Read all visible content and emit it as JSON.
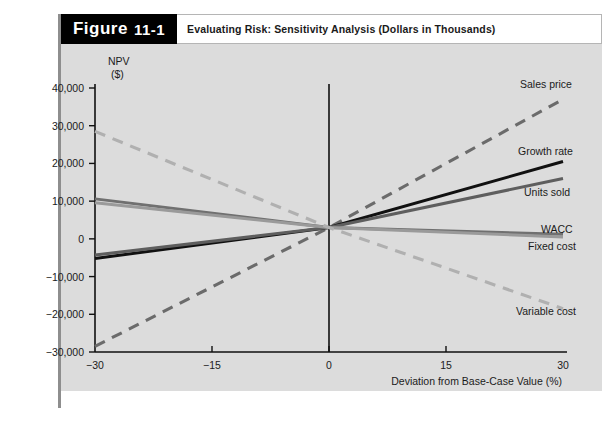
{
  "figure": {
    "tag_word": "Figure",
    "tag_number": "11-1",
    "caption": "Evaluating Risk: Sensitivity Analysis (Dollars in Thousands)"
  },
  "chart_data": {
    "type": "line",
    "title": "Evaluating Risk: Sensitivity Analysis (Dollars in Thousands)",
    "xlabel": "Deviation from Base-Case Value (%)",
    "ylabel": "NPV ($)",
    "ylabel_line1": "NPV",
    "ylabel_line2": "($)",
    "x": [
      -30,
      0,
      30
    ],
    "xlim": [
      -30,
      30
    ],
    "ylim": [
      -30000,
      40000
    ],
    "xticks": [
      -30,
      -15,
      0,
      15,
      30
    ],
    "xtick_labels": [
      "−30",
      "−15",
      "0",
      "15",
      "30"
    ],
    "yticks": [
      40000,
      30000,
      20000,
      10000,
      0,
      -10000,
      -20000,
      -30000
    ],
    "ytick_labels": [
      "40,000",
      "30,000",
      "20,000",
      "10,000",
      "0",
      "−10,000",
      "−20,000",
      "−30,000"
    ],
    "grid": false,
    "legend_position": "right-inline",
    "base_case_npv": 3000,
    "series": [
      {
        "name": "Sales price",
        "label": "Sales price",
        "values": [
          -28500,
          3000,
          37000
        ],
        "color": "#6b6b6b",
        "style": "dashed",
        "width": 3.1,
        "label_x": 520,
        "label_y": 88
      },
      {
        "name": "Growth rate",
        "label": "Growth rate",
        "values": [
          -5200,
          3000,
          20500
        ],
        "color": "#111111",
        "style": "solid",
        "width": 3.0,
        "label_x": 518,
        "label_y": 155
      },
      {
        "name": "Units sold",
        "label": "Units sold",
        "values": [
          -4300,
          3000,
          16000
        ],
        "color": "#5e5e5e",
        "style": "solid",
        "width": 3.0,
        "label_x": 524,
        "label_y": 196
      },
      {
        "name": "WACC",
        "label": "WACC",
        "values": [
          10600,
          3000,
          1200
        ],
        "color": "#707070",
        "style": "solid",
        "width": 3.0,
        "label_x": 541,
        "label_y": 233
      },
      {
        "name": "Fixed cost",
        "label": "Fixed cost",
        "values": [
          9600,
          3000,
          500
        ],
        "color": "#9a9a9a",
        "style": "solid",
        "width": 3.0,
        "label_x": 528,
        "label_y": 250
      },
      {
        "name": "Variable cost",
        "label": "Variable cost",
        "values": [
          28500,
          3000,
          -18500
        ],
        "color": "#b0b0b0",
        "style": "dashed",
        "width": 3.1,
        "label_x": 516,
        "label_y": 315
      }
    ]
  }
}
